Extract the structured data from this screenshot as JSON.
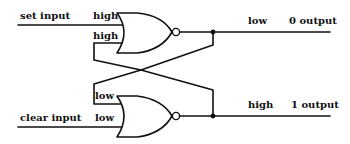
{
  "colors": {
    "ink": "#111111",
    "background": "#ffffff"
  },
  "inputs": {
    "set": {
      "label": "set input",
      "state": "high"
    },
    "clear": {
      "label": "clear input",
      "state": "low"
    }
  },
  "gates": {
    "top": {
      "type": "NOR",
      "input_states": [
        "high",
        "high"
      ]
    },
    "bottom": {
      "type": "NOR",
      "input_states": [
        "low",
        "low"
      ]
    }
  },
  "outputs": {
    "zero": {
      "label": "0 output",
      "state": "low"
    },
    "one": {
      "label": "1 output",
      "state": "high"
    }
  }
}
